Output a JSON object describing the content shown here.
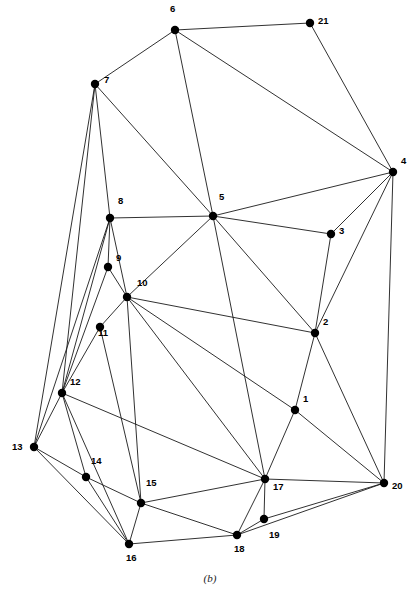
{
  "figure": {
    "caption": "(b)",
    "width": 420,
    "height": 601,
    "background_color": "#ffffff",
    "edge_color": "#1a1a1a",
    "vertex_color": "#000000"
  },
  "chart_data": {
    "type": "scatter",
    "title": "",
    "subtitle": "",
    "xlabel": "",
    "ylabel": "",
    "grid": false,
    "legend": "none",
    "xlim": [
      0,
      420
    ],
    "ylim": [
      0,
      601
    ],
    "vertex_count": 21,
    "edge_count": 52,
    "nodes": [
      {
        "id": "1",
        "x": 295,
        "y": 410,
        "label": "1",
        "label_dx": 8,
        "label_dy": -11
      },
      {
        "id": "2",
        "x": 315,
        "y": 333,
        "label": "2",
        "label_dx": 8,
        "label_dy": -11
      },
      {
        "id": "3",
        "x": 331,
        "y": 234,
        "label": "3",
        "label_dx": 8,
        "label_dy": -3
      },
      {
        "id": "4",
        "x": 393,
        "y": 172,
        "label": "4",
        "label_dx": 8,
        "label_dy": -11
      },
      {
        "id": "5",
        "x": 213,
        "y": 216,
        "label": "5",
        "label_dx": 6,
        "label_dy": -19
      },
      {
        "id": "6",
        "x": 175,
        "y": 30,
        "label": "6",
        "label_dx": -5,
        "label_dy": -21
      },
      {
        "id": "7",
        "x": 95,
        "y": 84,
        "label": "7",
        "label_dx": 9,
        "label_dy": -4
      },
      {
        "id": "8",
        "x": 110,
        "y": 218,
        "label": "8",
        "label_dx": 8,
        "label_dy": -17
      },
      {
        "id": "9",
        "x": 108,
        "y": 267,
        "label": "9",
        "label_dx": 8,
        "label_dy": -9
      },
      {
        "id": "10",
        "x": 127,
        "y": 297,
        "label": "10",
        "label_dx": 10,
        "label_dy": -14
      },
      {
        "id": "11",
        "x": 100,
        "y": 327,
        "label": "11",
        "label_dx": -2,
        "label_dy": 6
      },
      {
        "id": "12",
        "x": 62,
        "y": 393,
        "label": "12",
        "label_dx": 8,
        "label_dy": -11
      },
      {
        "id": "13",
        "x": 34,
        "y": 447,
        "label": "13",
        "label_dx": -22,
        "label_dy": 0
      },
      {
        "id": "14",
        "x": 86,
        "y": 477,
        "label": "14",
        "label_dx": 5,
        "label_dy": -16
      },
      {
        "id": "15",
        "x": 141,
        "y": 503,
        "label": "15",
        "label_dx": 5,
        "label_dy": -20
      },
      {
        "id": "16",
        "x": 129,
        "y": 544,
        "label": "16",
        "label_dx": -3,
        "label_dy": 14
      },
      {
        "id": "17",
        "x": 265,
        "y": 479,
        "label": "17",
        "label_dx": 8,
        "label_dy": 8
      },
      {
        "id": "18",
        "x": 237,
        "y": 535,
        "label": "18",
        "label_dx": -3,
        "label_dy": 14
      },
      {
        "id": "19",
        "x": 264,
        "y": 519,
        "label": "19",
        "label_dx": 5,
        "label_dy": 16
      },
      {
        "id": "20",
        "x": 384,
        "y": 483,
        "label": "20",
        "label_dx": 8,
        "label_dy": 3
      },
      {
        "id": "21",
        "x": 310,
        "y": 23,
        "label": "21",
        "label_dx": 8,
        "label_dy": -2
      }
    ],
    "edges": [
      [
        "6",
        "21"
      ],
      [
        "6",
        "7"
      ],
      [
        "6",
        "5"
      ],
      [
        "6",
        "4"
      ],
      [
        "21",
        "4"
      ],
      [
        "7",
        "8"
      ],
      [
        "7",
        "13"
      ],
      [
        "7",
        "12"
      ],
      [
        "7",
        "5"
      ],
      [
        "4",
        "5"
      ],
      [
        "4",
        "3"
      ],
      [
        "4",
        "2"
      ],
      [
        "4",
        "20"
      ],
      [
        "5",
        "8"
      ],
      [
        "5",
        "3"
      ],
      [
        "5",
        "2"
      ],
      [
        "5",
        "10"
      ],
      [
        "5",
        "17"
      ],
      [
        "3",
        "2"
      ],
      [
        "2",
        "1"
      ],
      [
        "2",
        "10"
      ],
      [
        "2",
        "20"
      ],
      [
        "1",
        "10"
      ],
      [
        "1",
        "17"
      ],
      [
        "1",
        "20"
      ],
      [
        "8",
        "9"
      ],
      [
        "8",
        "10"
      ],
      [
        "8",
        "12"
      ],
      [
        "8",
        "13"
      ],
      [
        "9",
        "10"
      ],
      [
        "9",
        "12"
      ],
      [
        "10",
        "11"
      ],
      [
        "10",
        "15"
      ],
      [
        "10",
        "17"
      ],
      [
        "11",
        "12"
      ],
      [
        "11",
        "15"
      ],
      [
        "12",
        "13"
      ],
      [
        "12",
        "14"
      ],
      [
        "12",
        "16"
      ],
      [
        "12",
        "17"
      ],
      [
        "13",
        "14"
      ],
      [
        "13",
        "16"
      ],
      [
        "14",
        "15"
      ],
      [
        "14",
        "16"
      ],
      [
        "15",
        "16"
      ],
      [
        "15",
        "17"
      ],
      [
        "15",
        "18"
      ],
      [
        "16",
        "18"
      ],
      [
        "17",
        "18"
      ],
      [
        "17",
        "19"
      ],
      [
        "17",
        "20"
      ],
      [
        "18",
        "19"
      ],
      [
        "18",
        "20"
      ],
      [
        "19",
        "20"
      ]
    ]
  }
}
